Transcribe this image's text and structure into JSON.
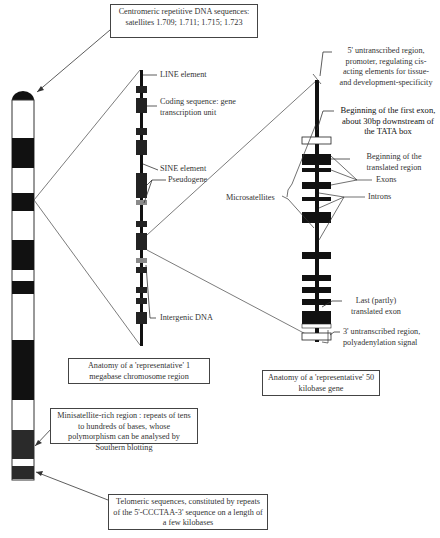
{
  "boxes": {
    "centromeric": "Centromeric repetitive DNA sequences: satellites 1.709; 1.711; 1.715; 1.723",
    "megabase": "Anatomy of a 'representative' 1 megabase chromosome region",
    "gene50kb": "Anatomy of a 'representative' 50 kilobase gene",
    "minisatellite": "Minisatellite-rich region : repeats of tens to hundreds of bases, whose polymorphism can be analysed by Southern blotting",
    "telomeric": "Telomeric sequences, constituted by repeats of the 5'-CCCTAA-3' sequence on a length of a few kilobases"
  },
  "megabase_labels": {
    "line": "LINE element",
    "coding": "Coding sequence: gene transcription unit",
    "sine": "SINE element",
    "pseudogene": "Pseudogene",
    "intergenic": "Intergenic DNA"
  },
  "gene_labels": {
    "untranscribed5": "5' untranscribed region, promoter, regulating cis-acting elements for tissue- and development-specificity",
    "first_exon": "Beginning of the first exon, about 30bp downstream of the TATA box",
    "translated_start": "Beginning of the translated region",
    "exons": "Exons",
    "introns": "Introns",
    "microsatellites": "Microsatellites",
    "last_exon": "Last (partly) translated exon",
    "untranscribed3": "3' untranscribed region, polyadenylation signal"
  },
  "colors": {
    "band_dark": "#111111",
    "pseudogene_gray": "#8a8a8a",
    "line": "#333333"
  }
}
